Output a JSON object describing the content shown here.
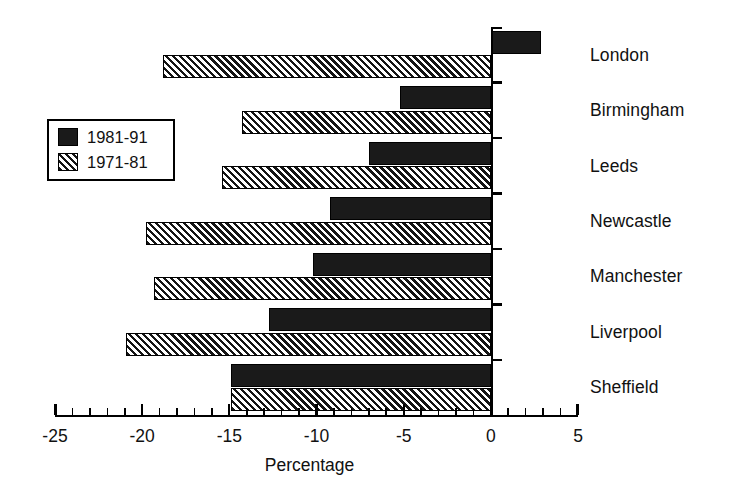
{
  "chart_data": {
    "type": "bar",
    "orientation": "horizontal",
    "title": "",
    "subtitle": "",
    "xlabel": "Percentage",
    "ylabel": "",
    "xlim": [
      -25,
      5
    ],
    "xticks": [
      -25,
      -20,
      -15,
      -10,
      -5,
      0,
      5
    ],
    "xtick_labels": [
      "-25",
      "-20",
      "-15",
      "-10",
      "-5",
      "0",
      "5"
    ],
    "minor_tick_step": 1,
    "grid": false,
    "legend_position": "upper-left-inside",
    "categories": [
      "London",
      "Birmingham",
      "Leeds",
      "Newcastle",
      "Manchester",
      "Liverpool",
      "Sheffield"
    ],
    "series": [
      {
        "name": "1981-91",
        "fill": "solid-black",
        "color": "#1a1a1a",
        "values": [
          2.9,
          -5.2,
          -7.0,
          -9.2,
          -10.2,
          -12.7,
          -14.9
        ]
      },
      {
        "name": "1971-81",
        "fill": "diagonal-hatch",
        "color": "#141414",
        "values": [
          -18.8,
          -14.3,
          -15.4,
          -19.8,
          -19.3,
          -20.9,
          -14.9
        ]
      }
    ]
  },
  "legend": {
    "entries": [
      {
        "label": "1981-91",
        "swatch": "solid"
      },
      {
        "label": "1971-81",
        "swatch": "hatch"
      }
    ]
  },
  "axis": {
    "x_title": "Percentage",
    "tick_labels": [
      "-25",
      "-20",
      "-15",
      "-10",
      "-5",
      "0",
      "5"
    ]
  },
  "categories": [
    "London",
    "Birmingham",
    "Leeds",
    "Newcastle",
    "Manchester",
    "Liverpool",
    "Sheffield"
  ],
  "colors": {
    "series_1981_91": "#1a1a1a",
    "series_1971_81": "#141414",
    "axis": "#000000",
    "background": "#ffffff",
    "text": "#111111"
  }
}
